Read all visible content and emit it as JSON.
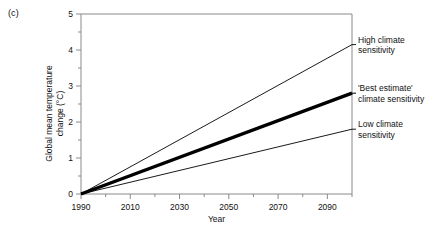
{
  "panel": {
    "label": "(c)"
  },
  "chart_data": {
    "type": "line",
    "title": "",
    "panel_label": "(c)",
    "xlabel": "Year",
    "ylabel": "Global mean temperature change (°C)",
    "ylabel_line1": "Global mean temperature",
    "ylabel_line2": "change (°C)",
    "xlim": [
      1990,
      2100
    ],
    "ylim": [
      0,
      5
    ],
    "x_ticks": [
      1990,
      2010,
      2030,
      2050,
      2070,
      2090
    ],
    "x_tick_labels": [
      "1990",
      "2010",
      "2030",
      "2050",
      "2070",
      "2090"
    ],
    "x_minor_step": 10,
    "y_ticks": [
      0,
      1,
      2,
      3,
      4,
      5
    ],
    "y_tick_labels": [
      "0",
      "1",
      "2",
      "3",
      "4",
      "5"
    ],
    "y_minor_step": 0.5,
    "grid": false,
    "legend_position": "right-inline-annotations",
    "series": [
      {
        "name": "High climate sensitivity",
        "label_line1": "High climate",
        "label_line2": "sensitivity",
        "color": "#000000",
        "linewidth": 0.9,
        "x": [
          1990,
          2100
        ],
        "values": [
          0,
          4.15
        ]
      },
      {
        "name": "'Best estimate' climate sensitivity",
        "label_line1": "'Best estimate'",
        "label_line2": "climate sensitivity",
        "color": "#000000",
        "linewidth": 3.4,
        "x": [
          1990,
          2100
        ],
        "values": [
          0,
          2.8
        ]
      },
      {
        "name": "Low climate sensitivity",
        "label_line1": "Low climate",
        "label_line2": "sensitivity",
        "color": "#000000",
        "linewidth": 0.9,
        "x": [
          1990,
          2100
        ],
        "values": [
          0,
          1.8
        ]
      }
    ]
  },
  "annotations": {
    "high": {
      "line1": "High climate",
      "line2": "sensitivity"
    },
    "best": {
      "line1": "'Best estimate'",
      "line2": "climate sensitivity"
    },
    "low": {
      "line1": "Low climate",
      "line2": "sensitivity"
    }
  },
  "axes": {
    "x_title": "Year",
    "y_title_line1": "Global mean temperature",
    "y_title_line2": "change (°C)"
  },
  "colors": {
    "axis": "#8a8a8a",
    "line": "#000000",
    "text": "#111111",
    "background": "#ffffff"
  }
}
